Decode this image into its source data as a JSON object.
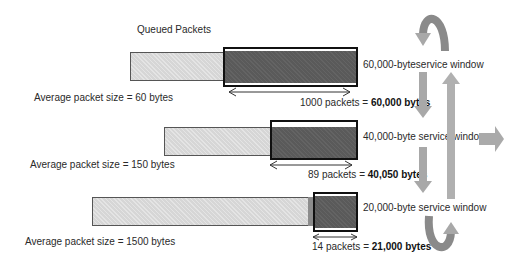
{
  "title": "Queued Packets",
  "rows": [
    {
      "avg_label": "Average packet size = 60 bytes",
      "packets_text": "1000 packets = ",
      "bytes_text": "60,000 bytes",
      "window_label": "60,000-byteservice window"
    },
    {
      "avg_label": "Average packet size = 150 bytes",
      "packets_text": "89 packets = ",
      "bytes_text": "40,050 bytes",
      "window_label": "40,000-byte service window"
    },
    {
      "avg_label": "Average packet size = 1500 bytes",
      "packets_text": "14 packets = ",
      "bytes_text": "21,000 bytes",
      "window_label": "20,000-byte service window"
    }
  ],
  "colors": {
    "queue_fill": "#d6d6d6",
    "window_fill": "#5a5a5a",
    "window_border": "#111111",
    "arrow_fill": "#a8a8a8",
    "arrow_dark": "#8a8a8a"
  }
}
